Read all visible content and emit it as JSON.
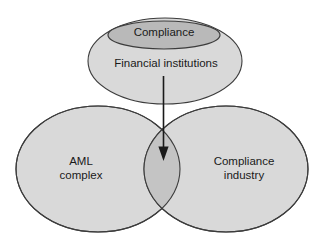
{
  "figure": {
    "type": "venn-diagram",
    "background_color": "#ffffff",
    "stroke_color": "#3c3c3c",
    "fill_light": "#d9d9d9",
    "fill_inner": "#b9b9b9",
    "fill_overlap": "#c4c4c4",
    "arrow_color": "#1a1a1a"
  },
  "shapes": {
    "top_ellipse": {
      "label": "Financial institutions",
      "fill": "#d9d9d9"
    },
    "inner_ellipse": {
      "label": "Compliance",
      "fill": "#b9b9b9"
    },
    "left_ellipse": {
      "label_line1": "AML",
      "label_line2": "complex",
      "label": "AML\ncomplex",
      "fill": "#d9d9d9"
    },
    "right_ellipse": {
      "label_line1": "Compliance",
      "label_line2": "industry",
      "label": "Compliance\nindustry",
      "fill": "#d9d9d9"
    },
    "overlap_region": {
      "fill": "#c4c4c4"
    }
  },
  "connector": {
    "name": "downward-arrow",
    "from": "Financial institutions",
    "to": "overlap of AML complex and Compliance industry"
  }
}
